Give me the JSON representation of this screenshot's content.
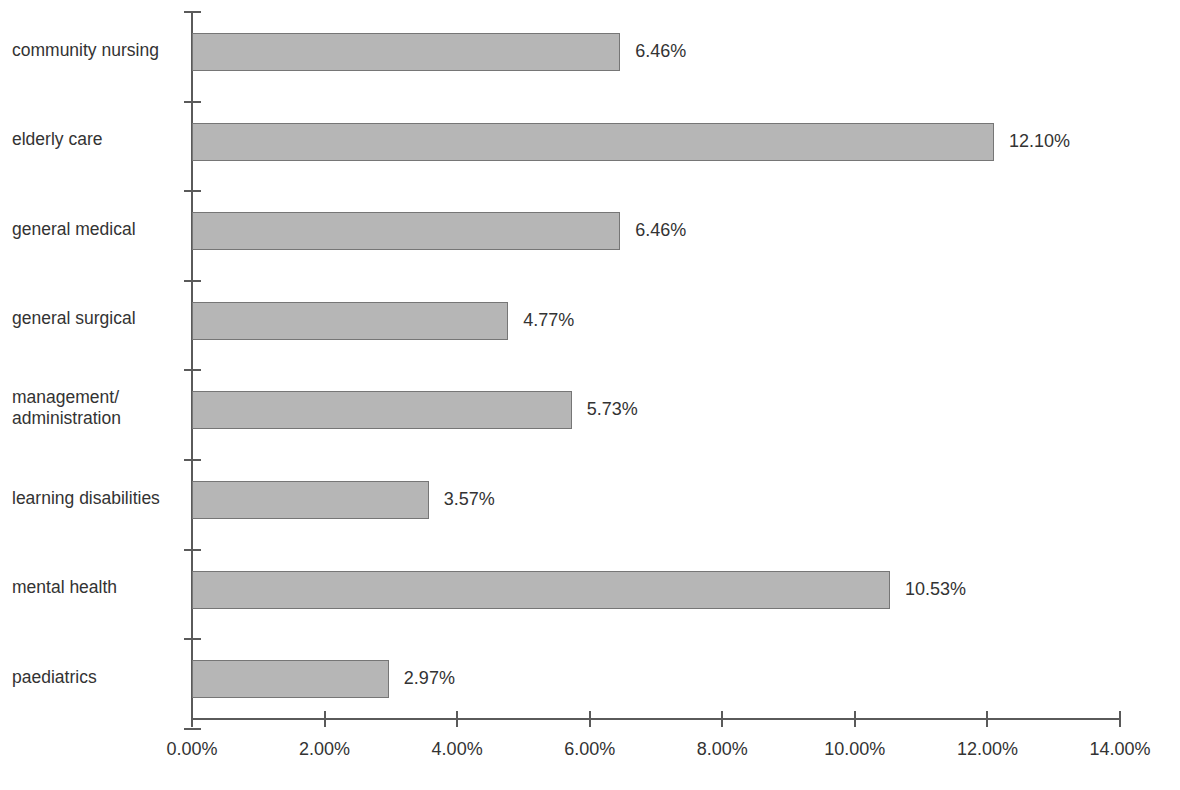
{
  "chart_data": {
    "type": "bar",
    "orientation": "horizontal",
    "title": "",
    "subtitle": "",
    "xlabel": "",
    "ylabel": "",
    "xlim": [
      0,
      14
    ],
    "ylim": null,
    "grid": false,
    "legend": null,
    "categories": [
      "community nursing",
      "elderly care",
      "general medical",
      "general surgical",
      "management/\nadministration",
      "learning disabilities",
      "mental health",
      "paediatrics"
    ],
    "values": [
      6.46,
      12.1,
      6.46,
      4.77,
      5.73,
      3.57,
      10.53,
      2.97
    ],
    "value_labels": [
      "6.46%",
      "12.10%",
      "6.46%",
      "4.77%",
      "5.73%",
      "3.57%",
      "10.53%",
      "2.97%"
    ],
    "x_ticks": [
      0,
      2,
      4,
      6,
      8,
      10,
      12,
      14
    ],
    "x_tick_labels": [
      "0.00%",
      "2.00%",
      "4.00%",
      "6.00%",
      "8.00%",
      "10.00%",
      "12.00%",
      "14.00%"
    ],
    "colors": {
      "bar_fill": "#b6b6b6",
      "bar_stroke": "#767676",
      "axis": "#5a5a5a",
      "text": "#333333",
      "background": "#ffffff"
    }
  }
}
